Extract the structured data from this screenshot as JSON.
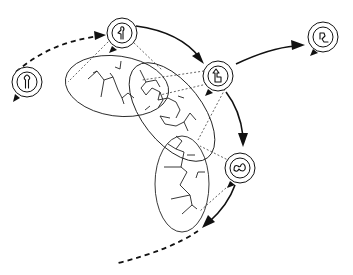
{
  "caption": {
    "text": "· · ·  · · ·"
  },
  "colors": {
    "line": "#111111",
    "background": "#ffffff"
  },
  "nodes": [
    {
      "id": "node-1",
      "label": "state-1",
      "glyph": "keyhole-glyph",
      "cx": 27,
      "cy": 82
    },
    {
      "id": "node-2",
      "label": "state-2",
      "glyph": "bent-keyhole-glyph",
      "cx": 122,
      "cy": 33
    },
    {
      "id": "node-3",
      "label": "state-3",
      "glyph": "chair-glyph",
      "cx": 218,
      "cy": 76
    },
    {
      "id": "node-4",
      "label": "state-4",
      "glyph": "hook-glyph",
      "cx": 323,
      "cy": 37
    },
    {
      "id": "node-5",
      "label": "state-5",
      "glyph": "squiggle-glyph",
      "cx": 240,
      "cy": 168
    }
  ],
  "edges": [
    {
      "from": "node-1",
      "to": "node-2",
      "style": "dashed"
    },
    {
      "from": "node-2",
      "to": "node-3",
      "style": "solid"
    },
    {
      "from": "node-3",
      "to": "node-4",
      "style": "solid"
    },
    {
      "from": "node-3",
      "to": "node-5",
      "style": "solid"
    },
    {
      "from": "node-5",
      "to": "offscreen",
      "style": "solid-then-dashed"
    }
  ],
  "regions": [
    {
      "id": "ellipse-1",
      "cx": 117,
      "cy": 86,
      "rx": 52,
      "ry": 30,
      "rotate": 8
    },
    {
      "id": "ellipse-2",
      "cx": 172,
      "cy": 110,
      "rx": 32,
      "ry": 58,
      "rotate": -38
    },
    {
      "id": "ellipse-3",
      "cx": 182,
      "cy": 183,
      "rx": 27,
      "ry": 48,
      "rotate": 0
    }
  ]
}
